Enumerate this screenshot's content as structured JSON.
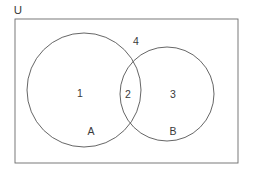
{
  "diagram": {
    "type": "venn",
    "title_label": "U",
    "universe": {
      "name": "U",
      "label": "U",
      "shape": "rectangle",
      "x": 15,
      "y": 19,
      "width": 223,
      "height": 144
    },
    "sets": [
      {
        "id": "A",
        "label": "A",
        "cx": 84,
        "cy": 90,
        "r": 57,
        "label_x": 91,
        "label_y": 132
      },
      {
        "id": "B",
        "label": "B",
        "cx": 167,
        "cy": 94,
        "r": 47,
        "label_x": 173,
        "label_y": 132
      }
    ],
    "regions": [
      {
        "id": "region-a-only",
        "label": "1",
        "description": "A only",
        "x": 80,
        "y": 94
      },
      {
        "id": "region-intersection",
        "label": "2",
        "description": "A intersect B",
        "x": 128,
        "y": 95
      },
      {
        "id": "region-b-only",
        "label": "3",
        "description": "B only",
        "x": 173,
        "y": 95
      },
      {
        "id": "region-outside",
        "label": "4",
        "description": "outside A and B",
        "x": 136,
        "y": 42
      }
    ],
    "colors": {
      "stroke": "#555555",
      "border": "#6b6b6b",
      "text": "#3a3a3a",
      "background": "#ffffff"
    },
    "stroke_width": 0.9
  }
}
